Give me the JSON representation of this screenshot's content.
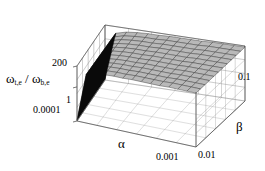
{
  "figure": {
    "kind": "3d-surface-plot",
    "background": "#ffffff",
    "line_color": "#8a8a8a",
    "frame_color": "#555555",
    "surface_fill": "#b9b9b9",
    "surface_edge": "#3a3a3a",
    "cliff_color": "#0a0a0a"
  },
  "axes": {
    "x": {
      "name": "α",
      "label_pos": {
        "x": 118,
        "y": 137
      },
      "ticks": [
        "0.001"
      ],
      "tick_positions": [
        {
          "label": "0.001",
          "x": 156,
          "y": 152
        }
      ]
    },
    "z": {
      "name": "β",
      "label_pos": {
        "x": 236,
        "y": 120
      },
      "ticks": [
        "0.1",
        "0.01"
      ],
      "tick_positions": [
        {
          "label": "0.1",
          "x": 238,
          "y": 72
        },
        {
          "label": "0.01",
          "x": 198,
          "y": 150
        }
      ]
    },
    "y": {
      "name_main": "ω",
      "name_sub1": "t,e",
      "name_mid": " / ",
      "name_main2": "ω",
      "name_sub2": "b,e",
      "label_pos": {
        "x": 6,
        "y": 72
      },
      "ticks": [
        "200",
        "1",
        "0.0001"
      ],
      "tick_positions": [
        {
          "label": "200",
          "x": 52,
          "y": 58
        },
        {
          "label": "1",
          "x": 66,
          "y": 95
        },
        {
          "label": "0.0001",
          "x": 33,
          "y": 105
        }
      ]
    }
  },
  "chart_data": {
    "type": "surface",
    "title": "",
    "xlabel": "α",
    "zlabel": "β",
    "ylabel": "ωt,e / ωb,e",
    "xlim": [
      0.001,
      0.1
    ],
    "zlim": [
      0.01,
      0.1
    ],
    "ylim": [
      0.0001,
      200
    ],
    "y_scale": "log",
    "x_scale": "log",
    "z_scale": "log",
    "xticks": [
      "0.001"
    ],
    "zticks": [
      "0.01",
      "0.1"
    ],
    "yticks": [
      "0.0001",
      "1",
      "200"
    ],
    "grid": true,
    "legend": "none",
    "nx": 14,
    "nz": 12,
    "plateau_value": 150,
    "cliff_value": 0.0003,
    "values_normalized": [
      [
        0.02,
        0.88,
        0.93,
        0.95,
        0.96,
        0.96,
        0.97,
        0.97,
        0.97,
        0.97,
        0.98,
        0.98,
        0.98,
        0.98
      ],
      [
        0.02,
        0.88,
        0.93,
        0.95,
        0.96,
        0.96,
        0.97,
        0.97,
        0.97,
        0.97,
        0.98,
        0.98,
        0.98,
        0.98
      ],
      [
        0.02,
        0.88,
        0.93,
        0.95,
        0.96,
        0.96,
        0.97,
        0.97,
        0.97,
        0.97,
        0.98,
        0.98,
        0.98,
        0.98
      ],
      [
        0.02,
        0.88,
        0.93,
        0.95,
        0.96,
        0.96,
        0.97,
        0.97,
        0.97,
        0.97,
        0.98,
        0.98,
        0.98,
        0.98
      ],
      [
        0.02,
        0.88,
        0.93,
        0.95,
        0.96,
        0.96,
        0.97,
        0.97,
        0.97,
        0.97,
        0.98,
        0.98,
        0.98,
        0.98
      ],
      [
        0.02,
        0.88,
        0.93,
        0.95,
        0.96,
        0.96,
        0.97,
        0.97,
        0.97,
        0.97,
        0.98,
        0.98,
        0.98,
        0.98
      ],
      [
        0.02,
        0.88,
        0.93,
        0.95,
        0.96,
        0.96,
        0.97,
        0.97,
        0.97,
        0.97,
        0.98,
        0.98,
        0.98,
        0.98
      ],
      [
        0.02,
        0.88,
        0.93,
        0.95,
        0.96,
        0.96,
        0.97,
        0.97,
        0.97,
        0.97,
        0.98,
        0.98,
        0.98,
        0.98
      ],
      [
        0.02,
        0.88,
        0.93,
        0.95,
        0.96,
        0.96,
        0.97,
        0.97,
        0.97,
        0.97,
        0.98,
        0.98,
        0.98,
        0.98
      ],
      [
        0.02,
        0.88,
        0.93,
        0.95,
        0.96,
        0.96,
        0.97,
        0.97,
        0.97,
        0.97,
        0.98,
        0.98,
        0.98,
        0.98
      ],
      [
        0.02,
        0.88,
        0.93,
        0.95,
        0.96,
        0.96,
        0.97,
        0.97,
        0.97,
        0.97,
        0.98,
        0.98,
        0.98,
        0.98
      ],
      [
        0.02,
        0.88,
        0.93,
        0.95,
        0.96,
        0.96,
        0.97,
        0.97,
        0.97,
        0.97,
        0.98,
        0.98,
        0.98,
        0.98
      ]
    ]
  },
  "geometry": {
    "corners_note": "projected 2D pixel coords of the unit box corners",
    "base": {
      "front_left": {
        "x": 77,
        "y": 121
      },
      "front_right": {
        "x": 196,
        "y": 147
      },
      "back_right": {
        "x": 245,
        "y": 101
      },
      "back_left": {
        "x": 105,
        "y": 80
      }
    },
    "top": {
      "front_left": {
        "x": 77,
        "y": 66
      },
      "front_right": {
        "x": 196,
        "y": 92
      },
      "back_right": {
        "x": 245,
        "y": 46
      },
      "back_left": {
        "x": 105,
        "y": 25
      }
    },
    "grid_divisions": {
      "x": 6,
      "z": 5,
      "y": 4
    }
  }
}
